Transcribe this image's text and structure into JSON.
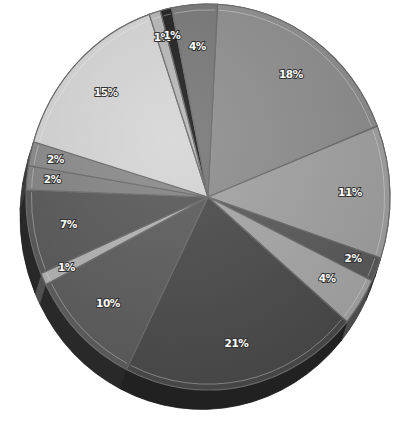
{
  "chart_data": {
    "type": "pie",
    "title": "",
    "style": "3d-tilted",
    "legend": "none",
    "start": "top",
    "direction": "clockwise",
    "slices": [
      {
        "label": "18%",
        "value": 18,
        "color": "#8e8e8e"
      },
      {
        "label": "11%",
        "value": 11,
        "color": "#a3a3a3"
      },
      {
        "label": "2%",
        "value": 2,
        "color": "#5a5a5a"
      },
      {
        "label": "4%",
        "value": 4,
        "color": "#a8a8a8"
      },
      {
        "label": "21%",
        "value": 21,
        "color": "#4a4a4a"
      },
      {
        "label": "10%",
        "value": 10,
        "color": "#5c5c5c"
      },
      {
        "label": "1%",
        "value": 1,
        "color": "#b4b4b4"
      },
      {
        "label": "7%",
        "value": 7,
        "color": "#585858"
      },
      {
        "label": "2%",
        "value": 2,
        "color": "#848484"
      },
      {
        "label": "2%",
        "value": 2,
        "color": "#8a8a8a"
      },
      {
        "label": "15%",
        "value": 15,
        "color": "#d6d6d6"
      },
      {
        "label": "1%",
        "value": 1,
        "color": "#b8b8b8"
      },
      {
        "label": "1%",
        "value": 1,
        "color": "#1e1e1e"
      },
      {
        "label": "4%",
        "value": 4,
        "color": "#777777"
      }
    ]
  }
}
